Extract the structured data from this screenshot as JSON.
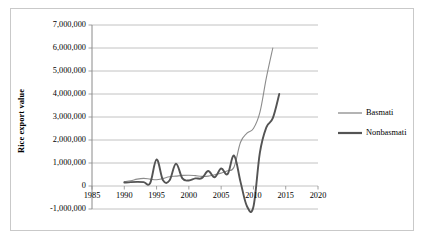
{
  "figure": {
    "background": "#ffffff",
    "frame_color": "#c9c9c9"
  },
  "chart_data": {
    "type": "line",
    "title": "",
    "xlabel": "",
    "ylabel": "Rice export value",
    "xlim": [
      1985,
      2020
    ],
    "ylim": [
      -1000000,
      7000000
    ],
    "xticks": [
      1985,
      1990,
      1995,
      2000,
      2005,
      2010,
      2015,
      2020
    ],
    "xtick_labels": [
      "1985",
      "1990",
      "1995",
      "2000",
      "2005",
      "2010",
      "2015",
      "2020"
    ],
    "yticks": [
      -1000000,
      0,
      1000000,
      2000000,
      3000000,
      4000000,
      5000000,
      6000000,
      7000000
    ],
    "ytick_labels": [
      "-1,000,000",
      "0",
      "1,000,000",
      "2,000,000",
      "3,000,000",
      "4,000,000",
      "5,000,000",
      "6,000,000",
      "7,000,000"
    ],
    "grid": true,
    "grid_axis": "y",
    "grid_color": "#b3b3b3",
    "legend_position": "right",
    "series": [
      {
        "name": "Basmati",
        "color": "#8c8c8c",
        "line_width": 1.1,
        "x": [
          1990,
          1991,
          1992,
          1993,
          1994,
          1995,
          1996,
          1997,
          1998,
          1999,
          2000,
          2001,
          2002,
          2003,
          2004,
          2005,
          2006,
          2007,
          2008,
          2009,
          2010,
          2011,
          2012,
          2013
        ],
        "values": [
          190000,
          230000,
          300000,
          330000,
          300000,
          270000,
          330000,
          400000,
          430000,
          460000,
          470000,
          450000,
          420000,
          430000,
          490000,
          560000,
          660000,
          830000,
          1900000,
          2300000,
          2500000,
          3200000,
          4700000,
          6000000
        ]
      },
      {
        "name": "Nonbasmati",
        "color": "#545454",
        "line_width": 1.9,
        "x": [
          1990,
          1991,
          1992,
          1993,
          1994,
          1995,
          1996,
          1997,
          1998,
          1999,
          2000,
          2001,
          2002,
          2003,
          2004,
          2005,
          2006,
          2007,
          2008,
          2009,
          2010,
          2011,
          2012,
          2013,
          2014
        ],
        "values": [
          150000,
          170000,
          180000,
          170000,
          120000,
          1150000,
          250000,
          240000,
          970000,
          330000,
          240000,
          330000,
          340000,
          650000,
          380000,
          760000,
          520000,
          1320000,
          180000,
          -880000,
          -900000,
          1450000,
          2550000,
          2950000,
          4000000
        ]
      }
    ]
  },
  "legend": {
    "items": [
      {
        "label": "Basmati",
        "color": "#8c8c8c",
        "thickness": 1.3
      },
      {
        "label": "Nonbasmati",
        "color": "#545454",
        "thickness": 2.2
      }
    ]
  }
}
